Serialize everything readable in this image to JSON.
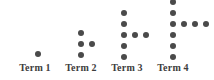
{
  "figure": {
    "background_color": "#ffffff",
    "dot_color": "#4a4a4a",
    "label_color": "#3d3d3d"
  },
  "chart_data": {
    "type": "scatter",
    "title": "",
    "xlabel": "",
    "ylabel": "",
    "categories": [
      "Term 1",
      "Term 2",
      "Term 3",
      "Term 4"
    ],
    "values": [
      1,
      4,
      7,
      10
    ],
    "series": [
      {
        "name": "Vertical column dots",
        "values": [
          1,
          3,
          5,
          7
        ]
      },
      {
        "name": "Horizontal arm dots",
        "values": [
          0,
          1,
          2,
          3
        ]
      },
      {
        "name": "Total dots",
        "values": [
          1,
          4,
          7,
          10
        ]
      }
    ],
    "annotations": [
      "Shape: vertical column with a horizontal arm extending right from the middle row",
      "Column count grows by 2 each term: 1, 3, 5, 7",
      "Arm count grows by 1 each term: 0, 1, 2, 3",
      "Total count grows by 3 each term: 1, 4, 7, 10"
    ],
    "grid": false,
    "legend": "none"
  },
  "terms": [
    {
      "label": "Term 1",
      "column_dots": 1,
      "arm_dots": 0,
      "total_dots": 1,
      "left": 4,
      "width": 62,
      "column_x": 31,
      "column_bottom_y": 51,
      "dot_spacing": 11,
      "arm_y": 51
    },
    {
      "label": "Term 2",
      "column_dots": 3,
      "arm_dots": 1,
      "total_dots": 4,
      "left": 50,
      "width": 62,
      "column_x": 28,
      "column_bottom_y": 52,
      "dot_spacing": 11,
      "arm_y": 41
    },
    {
      "label": "Term 3",
      "column_dots": 5,
      "arm_dots": 2,
      "total_dots": 7,
      "left": 96,
      "width": 62,
      "column_x": 25,
      "column_bottom_y": 54,
      "dot_spacing": 11,
      "arm_y": 32
    },
    {
      "label": "Term 4",
      "column_dots": 7,
      "arm_dots": 3,
      "total_dots": 10,
      "left": 142,
      "width": 62,
      "column_x": 28,
      "column_bottom_y": 54,
      "dot_spacing": 11,
      "arm_y": 21
    }
  ]
}
